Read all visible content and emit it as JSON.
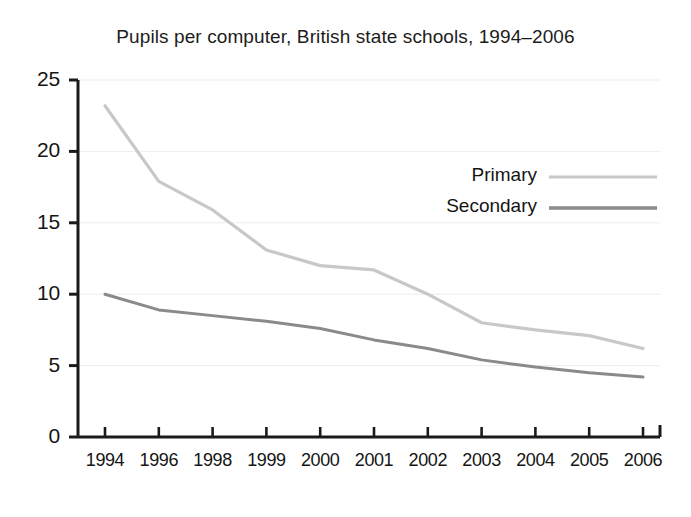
{
  "chart_data": {
    "type": "line",
    "title": "Pupils per computer, British state schools, 1994–2006",
    "xlabel": "",
    "ylabel": "",
    "categories": [
      "1994",
      "1996",
      "1998",
      "1999",
      "2000",
      "2001",
      "2002",
      "2003",
      "2004",
      "2005",
      "2006"
    ],
    "series": [
      {
        "name": "Primary",
        "color": "#c8c8c8",
        "values": [
          23.2,
          17.9,
          15.9,
          13.1,
          12.0,
          11.7,
          10.0,
          8.0,
          7.5,
          7.1,
          6.2
        ]
      },
      {
        "name": "Secondary",
        "color": "#8a8a8a",
        "values": [
          10.0,
          8.9,
          8.5,
          8.1,
          7.6,
          6.8,
          6.2,
          5.4,
          4.9,
          4.5,
          4.2
        ]
      }
    ],
    "ylim": [
      0,
      25
    ],
    "yticks": [
      "0",
      "5",
      "10",
      "15",
      "20",
      "25"
    ],
    "grid": true,
    "grid_axis": "y",
    "legend_position": "inside-upper-right"
  },
  "axes": {
    "y_tick_labels": [
      "25",
      "20",
      "15",
      "10",
      "5",
      "0"
    ],
    "x_tick_labels": [
      "1994",
      "1996",
      "1998",
      "1999",
      "2000",
      "2001",
      "2002",
      "2003",
      "2004",
      "2005",
      "2006"
    ]
  },
  "legend": {
    "entries": [
      {
        "label": "Primary",
        "color": "#c8c8c8"
      },
      {
        "label": "Secondary",
        "color": "#8a8a8a"
      }
    ]
  },
  "colors": {
    "primary_line": "#c8c8c8",
    "secondary_line": "#8a8a8a",
    "axis": "#1a1a1a",
    "gridline": "#ededed",
    "background": "#ffffff",
    "text": "#151515"
  }
}
